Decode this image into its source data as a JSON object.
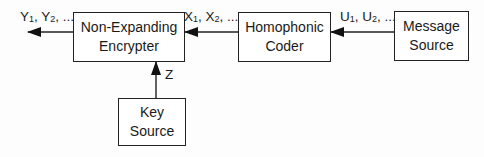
{
  "diagram": {
    "type": "block-diagram",
    "boxes": {
      "encrypter": {
        "line1": "Non-Expanding",
        "line2": "Encrypter"
      },
      "homophonic": {
        "line1": "Homophonic",
        "line2": "Coder"
      },
      "message": {
        "line1": "Message",
        "line2": "Source"
      },
      "key": {
        "line1": "Key",
        "line2": "Source"
      }
    },
    "labels": {
      "y": {
        "v1": "Y",
        "s1": "1",
        "sep": ", ",
        "v2": "Y",
        "s2": "2",
        "tail": ", ..."
      },
      "x": {
        "v1": "X",
        "s1": "1",
        "sep": ", ",
        "v2": "X",
        "s2": "2",
        "tail": ", ..."
      },
      "u": {
        "v1": "U",
        "s1": "1",
        "sep": ", ",
        "v2": "U",
        "s2": "2",
        "tail": ", ..."
      },
      "z": "Z"
    },
    "edges": [
      {
        "from": "message",
        "to": "homophonic",
        "label": "U1, U2, ..."
      },
      {
        "from": "homophonic",
        "to": "encrypter",
        "label": "X1, X2, ..."
      },
      {
        "from": "encrypter",
        "to": "output",
        "label": "Y1, Y2, ..."
      },
      {
        "from": "key",
        "to": "encrypter",
        "label": "Z"
      }
    ]
  }
}
